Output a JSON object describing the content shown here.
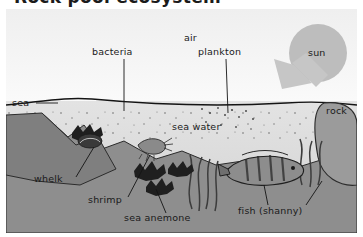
{
  "page": {
    "heading": "Rock pool ecosystem",
    "watermark": "elearning"
  },
  "figure": {
    "labels": [
      {
        "id": "air",
        "text": "air",
        "x": 178,
        "y": 30
      },
      {
        "id": "bacteria",
        "text": "bacteria",
        "x": 109,
        "y": 44
      },
      {
        "id": "plankton",
        "text": "plankton",
        "x": 206,
        "y": 44
      },
      {
        "id": "sun",
        "text": "sun",
        "x": 312,
        "y": 42
      },
      {
        "id": "sea",
        "text": "sea",
        "x": 12,
        "y": 96
      },
      {
        "id": "rock",
        "text": "rock",
        "x": 325,
        "y": 102
      },
      {
        "id": "sea-water",
        "text": "sea water",
        "x": 173,
        "y": 120
      },
      {
        "id": "whelk",
        "text": "whelk",
        "x": 52,
        "y": 172
      },
      {
        "id": "shrimp",
        "text": "shrimp",
        "x": 100,
        "y": 193
      },
      {
        "id": "sea-anemone",
        "text": "sea anemone",
        "x": 145,
        "y": 210
      },
      {
        "id": "fish-shanny",
        "text": "fish (shanny)",
        "x": 243,
        "y": 203
      }
    ],
    "organisms": [
      {
        "name": "whelk",
        "description": "marine snail on rock"
      },
      {
        "name": "shrimp",
        "description": "small crustacean in pool"
      },
      {
        "name": "sea-anemone",
        "description": "dark tentacled anemone clusters"
      },
      {
        "name": "shanny-fish",
        "description": "striped blenny fish swimming"
      },
      {
        "name": "seaweed",
        "description": "green fronds on seabed"
      },
      {
        "name": "plankton",
        "description": "floating specks near surface"
      },
      {
        "name": "bacteria",
        "description": "specks in water column"
      }
    ],
    "colors": {
      "sky": "#f2f2f2",
      "water": "#dcdcdc",
      "rock": "#9a9a9a",
      "seabed": "#8f8f8f",
      "sun": "#b9b9b9",
      "arrow": "#c4c4c4",
      "line": "#1a1a1a"
    }
  }
}
